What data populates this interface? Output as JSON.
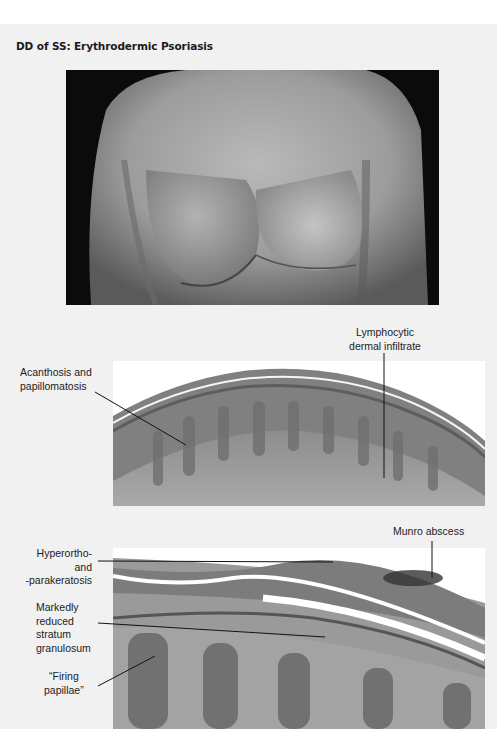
{
  "page": {
    "title": "DD of SS: Erythrodermic Psoriasis"
  },
  "figures": [
    {
      "id": "clinical-photo",
      "description": "Clinical photograph of erythrodermic psoriasis on chest/trunk"
    },
    {
      "id": "histology-low-power",
      "description": "Low-power histology section"
    },
    {
      "id": "histology-high-power",
      "description": "High-power histology section"
    }
  ],
  "annotations": {
    "acanthosis": "Acanthosis and\npapillomatosis",
    "lymphocytic": "Lymphocytic\ndermal infiltrate",
    "munro": "Munro abscess",
    "hyperortho": "Hyperortho-\nand\n-parakeratosis",
    "granulosum": "Markedly\nreduced\nstratum\ngranulosum",
    "firing": "“Firing\npapillae”"
  },
  "colors": {
    "panel_bg": "#f1f1f1",
    "text": "#1c1c1c",
    "photo_bg": "#0b0b0b"
  }
}
